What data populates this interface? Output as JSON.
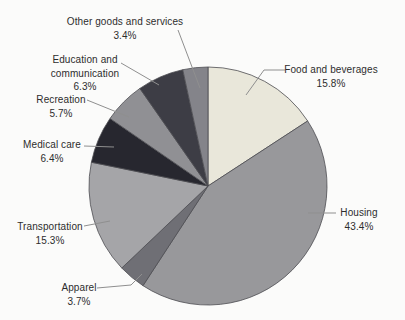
{
  "figure": {
    "background": "#fbfbfa",
    "width": 405,
    "height": 320
  },
  "chart_data": {
    "type": "pie",
    "title": "",
    "unit": "percent",
    "total": 100,
    "start_angle_deg": 0,
    "direction": "clockwise",
    "center_x": 208,
    "center_y": 186,
    "radius": 119,
    "slice_stroke": "#4c4c52",
    "leader_color": "#8f8f8f",
    "text_color": "#2d2d2d",
    "categories": [
      "Food and beverages",
      "Housing",
      "Apparel",
      "Transportation",
      "Medical care",
      "Recreation",
      "Education and communication",
      "Other goods and services"
    ],
    "values": [
      15.8,
      43.4,
      3.7,
      15.3,
      6.4,
      5.7,
      6.3,
      3.4
    ],
    "slices": [
      {
        "id": "food-and-beverages",
        "label": "Food and beverages",
        "value": 15.8,
        "pct": "15.8%",
        "color": "#e9e7da",
        "display": [
          "Food and beverages",
          "15.8%"
        ],
        "label_x": 331,
        "label_y": 63,
        "leader": [
          [
            285,
            70
          ],
          [
            264,
            70
          ],
          [
            246,
            95
          ]
        ]
      },
      {
        "id": "housing",
        "label": "Housing",
        "value": 43.4,
        "pct": "43.4%",
        "color": "#98989b",
        "display": [
          "Housing",
          "43.4%"
        ],
        "label_x": 359,
        "label_y": 206,
        "leader": [
          [
            336,
            213
          ],
          [
            308,
            213
          ]
        ]
      },
      {
        "id": "apparel",
        "label": "Apparel",
        "value": 3.7,
        "pct": "3.7%",
        "color": "#6f6f75",
        "display": [
          "Apparel",
          "3.7%"
        ],
        "label_x": 79,
        "label_y": 281,
        "leader": [
          [
            97,
            288
          ],
          [
            131,
            285
          ],
          [
            142,
            274
          ]
        ]
      },
      {
        "id": "transportation",
        "label": "Transportation",
        "value": 15.3,
        "pct": "15.3%",
        "color": "#a5a5a8",
        "display": [
          "Transportation",
          "15.3%"
        ],
        "label_x": 50,
        "label_y": 220,
        "leader": [
          [
            84,
            226
          ],
          [
            110,
            221
          ]
        ]
      },
      {
        "id": "medical-care",
        "label": "Medical care",
        "value": 6.4,
        "pct": "6.4%",
        "color": "#27272f",
        "display": [
          "Medical care",
          "6.4%"
        ],
        "label_x": 52,
        "label_y": 138,
        "leader": [
          [
            84,
            146
          ],
          [
            114,
            147
          ]
        ]
      },
      {
        "id": "recreation",
        "label": "Recreation",
        "value": 5.7,
        "pct": "5.7%",
        "color": "#909094",
        "display": [
          "Recreation",
          "5.7%"
        ],
        "label_x": 61,
        "label_y": 93,
        "leader": [
          [
            87,
            100
          ],
          [
            129,
            117
          ]
        ]
      },
      {
        "id": "education-and-communication",
        "label": "Education and communication",
        "value": 6.3,
        "pct": "6.3%",
        "color": "#3d3d45",
        "display": [
          "Education and",
          "communication",
          "6.3%"
        ],
        "label_x": 85,
        "label_y": 53,
        "leader": [
          [
            121,
            63
          ],
          [
            159,
            85
          ]
        ]
      },
      {
        "id": "other-goods-and-services",
        "label": "Other goods and services",
        "value": 3.4,
        "pct": "3.4%",
        "color": "#84848a",
        "display": [
          "Other goods and services",
          "3.4%"
        ],
        "label_x": 125,
        "label_y": 15,
        "leader": [
          [
            178,
            30
          ],
          [
            200,
            88
          ]
        ]
      }
    ]
  }
}
